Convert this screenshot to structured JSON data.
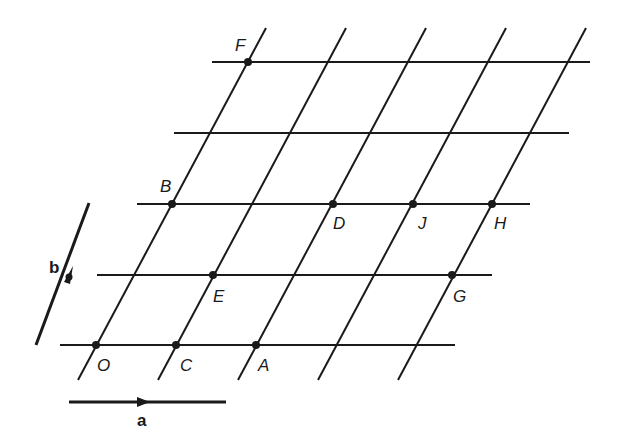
{
  "diagram": {
    "title": "",
    "type": "2D lattice with basis vectors",
    "basis_vectors": {
      "a": {
        "label": "a"
      },
      "b": {
        "label": "b"
      }
    },
    "lattice_points": [
      {
        "label": "O",
        "coords": [
          0,
          0
        ]
      },
      {
        "label": "C",
        "coords": [
          1,
          0
        ]
      },
      {
        "label": "A",
        "coords": [
          2,
          0
        ]
      },
      {
        "label": "E",
        "coords": [
          1,
          1
        ]
      },
      {
        "label": "G",
        "coords": [
          4,
          1
        ]
      },
      {
        "label": "B",
        "coords": [
          0,
          2
        ]
      },
      {
        "label": "D",
        "coords": [
          2,
          2
        ]
      },
      {
        "label": "J",
        "coords": [
          3,
          2
        ]
      },
      {
        "label": "H",
        "coords": [
          4,
          2
        ]
      },
      {
        "label": "F",
        "coords": [
          0,
          4
        ]
      }
    ],
    "rows": 5,
    "oblique_lines": 5,
    "colors": {
      "ink": "#1a1a1a",
      "background": "#ffffff"
    }
  }
}
